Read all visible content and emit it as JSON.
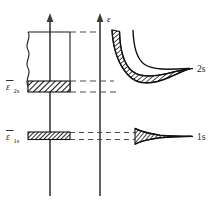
{
  "figure": {
    "background_color": "#ffffff",
    "ink_color": "#1a1a1a",
    "axis_color": "#3a3a3a"
  },
  "axes": {
    "left_axis": {
      "name": "left-vertical-axis",
      "label": "",
      "has_arrow": true,
      "x": 50,
      "y_top": 14,
      "y_bottom": 196
    },
    "right_axis": {
      "name": "energy-axis",
      "label": "ε",
      "has_arrow": true,
      "x": 100,
      "y_top": 14,
      "y_bottom": 196
    }
  },
  "left_panel": {
    "band_box": {
      "label": "",
      "top_y": 32,
      "bottom_y": 92,
      "left_x": 28,
      "right_x": 70,
      "break_symbol": "wavy-left-edge"
    },
    "levels": [
      {
        "name": "level-2s",
        "label_base": "ε",
        "label_sub": "2s",
        "label_overbar": true,
        "band_top_y": 81,
        "band_bottom_y": 92,
        "band_left_x": 28,
        "band_right_x": 70,
        "hatched": true
      },
      {
        "name": "level-1s",
        "label_base": "ε",
        "label_sub": "1s",
        "label_overbar": true,
        "band_top_y": 132,
        "band_bottom_y": 140,
        "band_left_x": 28,
        "band_right_x": 70,
        "hatched": true
      }
    ]
  },
  "connectors": {
    "dashed_lines": [
      {
        "name": "dash-box-top",
        "y": 32,
        "x_start": 70,
        "x_end": 100
      },
      {
        "name": "dash-2s-top",
        "y": 81,
        "x_start": 70,
        "x_end": 113
      },
      {
        "name": "dash-2s-bottom",
        "y": 92,
        "x_start": 70,
        "x_end": 113
      },
      {
        "name": "dash-1s-top",
        "y": 133,
        "x_start": 70,
        "x_end": 134
      },
      {
        "name": "dash-1s-bottom",
        "y": 139,
        "x_start": 70,
        "x_end": 134
      }
    ]
  },
  "right_panel": {
    "curves": [
      {
        "name": "band-2s",
        "label": "2s",
        "label_x": 198,
        "label_y": 70,
        "description": "2s band broadening: hatched lens-shaped region converging to a line",
        "asymptote_y": 68,
        "start_x": 112,
        "end_x": 190
      },
      {
        "name": "curve-upper-2s",
        "label": "",
        "description": "upper branch of 2s band, thin curve",
        "start_x": 133,
        "end_x": 190
      },
      {
        "name": "band-1s",
        "label": "1s",
        "label_x": 198,
        "label_y": 136,
        "description": "1s band: narrow wedge tapering into a line",
        "asymptote_y": 136,
        "start_x": 134,
        "end_x": 190
      }
    ]
  },
  "labels": {
    "energy_axis_label": "ε",
    "level_2s_label": "ε",
    "level_2s_sub": "2s",
    "level_1s_label": "ε",
    "level_1s_sub": "1s",
    "right_2s": "2s",
    "right_1s": "1s"
  }
}
